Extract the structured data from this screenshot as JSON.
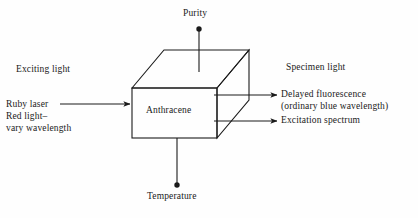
{
  "figure": {
    "background_color": "#fefefe",
    "line_color": "#1a1a1a"
  },
  "box": {
    "material_label": "Anthracene"
  },
  "labels": {
    "purity": "Purity",
    "temperature": "Temperature",
    "exciting_light": "Exciting light",
    "specimen_light": "Specimen light",
    "ruby_laser": "Ruby laser",
    "red_light_vary": "Red light–\nvary wavelength",
    "delayed_fluorescence": "Delayed fluorescence\n(ordinary blue wavelength)",
    "excitation_spectrum": "Excitation spectrum"
  },
  "connectors": [
    {
      "name": "purity-stem",
      "style": "line-with-dot",
      "from": "above-box",
      "to": "box-top"
    },
    {
      "name": "temperature-stem",
      "style": "line-with-dot",
      "from": "box-bottom",
      "to": "below-box"
    },
    {
      "name": "input-arrow",
      "style": "arrow",
      "from": "left-text",
      "to": "box-left-face"
    },
    {
      "name": "delayed-fluorescence-arrow",
      "style": "arrow",
      "from": "box-right-face",
      "to": "right-text"
    },
    {
      "name": "excitation-spectrum-arrow",
      "style": "arrow",
      "from": "box-right-face",
      "to": "right-text"
    }
  ]
}
